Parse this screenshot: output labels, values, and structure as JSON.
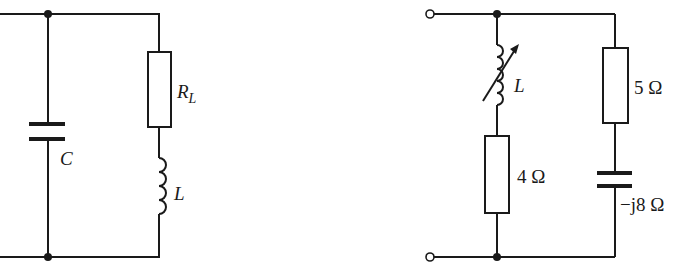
{
  "figures": [
    {
      "id": "left-circuit",
      "description": "Parallel resonant circuit: capacitor C in parallel with series R_L and L",
      "labels": {
        "capacitor": "C",
        "resistor_main": "R",
        "resistor_sub": "L",
        "inductor": "L"
      }
    },
    {
      "id": "right-circuit",
      "description": "Two-terminal network: variable inductor L in series with 4 Ω, in parallel with 5 Ω in series with −j8 Ω capacitor",
      "labels": {
        "variable_inductor": "L",
        "resistor_left": "4 Ω",
        "resistor_right": "5 Ω",
        "capacitor": "−j8 Ω"
      }
    }
  ],
  "colors": {
    "ink": "#1a1a1a",
    "background": "#ffffff"
  }
}
